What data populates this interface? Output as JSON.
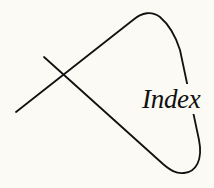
{
  "graphic": {
    "label": "Index",
    "stroke_color": "#111111",
    "background_color": "#fbfaf5"
  }
}
